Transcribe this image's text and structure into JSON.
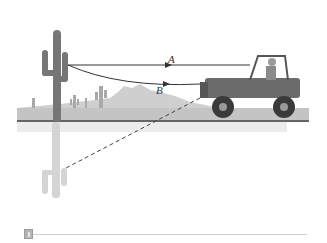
{
  "figure": {
    "labels": {
      "rope_a": "A",
      "rope_b": "B"
    },
    "elements": {
      "cactus": "saguaro cactus anchor",
      "vehicle": "jeep with driver",
      "rope_a": "straight taut rope",
      "rope_b": "sagging rope",
      "reflection_line": "dashed line to reflected cactus"
    },
    "colors": {
      "ground": "#bdbdbd",
      "mountains": "#c9c9c9",
      "cactus": "#7a7a7a",
      "jeep": "#6e6e6e",
      "ground_line": "#333333",
      "reflection": "#d6d6d6"
    }
  },
  "footer": {
    "badge_icon": "figure-badge-icon"
  }
}
